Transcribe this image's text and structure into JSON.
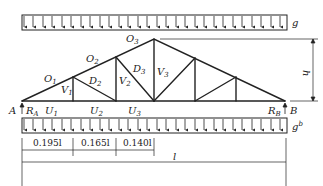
{
  "diagram": {
    "loads": {
      "top": {
        "label": "g"
      },
      "bottom": {
        "label": "g",
        "label_sup": "b"
      }
    },
    "nodes": {
      "left_support": "A",
      "right_support": "B"
    },
    "reactions": {
      "left": {
        "label": "R",
        "sub": "A"
      },
      "right": {
        "label": "R",
        "sub": "B"
      }
    },
    "members": {
      "top_chord": [
        {
          "label": "O",
          "sub": "1"
        },
        {
          "label": "O",
          "sub": "2"
        },
        {
          "label": "O",
          "sub": "3"
        }
      ],
      "verticals": [
        {
          "label": "V",
          "sub": "1"
        },
        {
          "label": "V",
          "sub": "2"
        },
        {
          "label": "V",
          "sub": "3"
        }
      ],
      "diagonals": [
        {
          "label": "D",
          "sub": "2"
        },
        {
          "label": "D",
          "sub": "3"
        }
      ],
      "bottom_chord": [
        {
          "label": "U",
          "sub": "1"
        },
        {
          "label": "U",
          "sub": "2"
        },
        {
          "label": "U",
          "sub": "3"
        }
      ]
    },
    "dimensions": {
      "height": "h",
      "segments": [
        "0.195l",
        "0.165l",
        "0.140l"
      ],
      "span": "l"
    },
    "colors": {
      "line": "#222222",
      "background": "#ffffff"
    }
  }
}
